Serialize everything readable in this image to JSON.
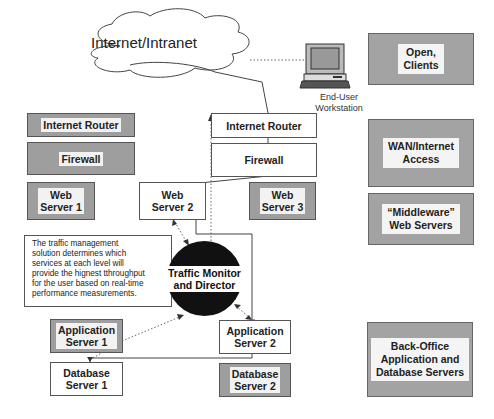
{
  "cloud": {
    "label": "Internet/Intranet"
  },
  "workstation": {
    "label": "End-User\nWorkstation",
    "icon": "computer-icon"
  },
  "left_column": {
    "internet_router": "Internet Router",
    "firewall": "Firewall",
    "web_server_1": "Web\nServer 1"
  },
  "center_column": {
    "internet_router": "Internet Router",
    "firewall": "Firewall",
    "web_server_2": "Web\nServer 2",
    "web_server_3": "Web\nServer 3"
  },
  "note": {
    "text": "The traffic management\nsolution determines which\nservices at each level will\nprovide the hignest tthroughput\nfor the user based on real-time\nperformance measurements."
  },
  "traffic_director": {
    "label": "Traffic Monitor\nand Director"
  },
  "app_servers": {
    "server_1": "Application\nServer 1",
    "server_2": "Application\nServer 2"
  },
  "db_servers": {
    "server_1": "Database\nServer 1",
    "server_2": "Database\nServer 2"
  },
  "tiers": [
    {
      "label": "Open,\nClients"
    },
    {
      "label": "WAN/Internet\nAccess"
    },
    {
      "label": "“Middleware”\nWeb Servers"
    },
    {
      "label": "Back-Office\nApplication and\nDatabase Servers"
    }
  ],
  "colors": {
    "active_box": "#ffffff",
    "inactive_box": "#9e9e9e",
    "director_circle": "#111111",
    "tier_box": "#a3a3a3"
  }
}
